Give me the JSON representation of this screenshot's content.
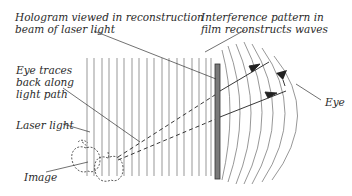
{
  "diagram": {
    "labels": {
      "hologram": "Hologram viewed in reconstruction\nbeam of laser light",
      "interference": "Interference pattern in\nfilm reconstructs waves",
      "eye_traces": "Eye traces\nback along\nlight path",
      "laser_light": "Laser light",
      "image": "Image",
      "eye": "Eye"
    },
    "elements": {
      "laser_wavefronts": "vertical parallel lines (reconstruction beam)",
      "hologram_plate": "gray vertical film plate",
      "reconstructed_waves": "curved wavefronts emerging right of plate",
      "virtual_image": "dashed apple outlines",
      "light_rays": "solid arrows from plate to eye",
      "traced_rays": "dashed lines from plate back to image"
    },
    "colors": {
      "line": "#555555",
      "plate_fill": "#7a7a7a",
      "plate_stroke": "#333333",
      "text": "#2a2a2a"
    }
  }
}
